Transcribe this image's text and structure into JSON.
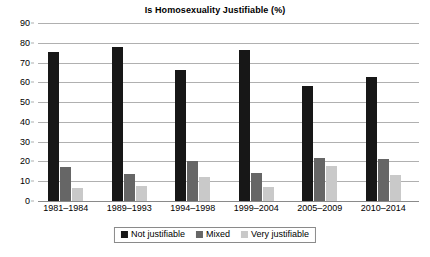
{
  "chart_data": {
    "type": "bar",
    "title": "Is Homosexuality Justifiable (%)",
    "xlabel": "",
    "ylabel": "",
    "ylim": [
      0,
      90
    ],
    "yticks": [
      0,
      10,
      20,
      30,
      40,
      50,
      60,
      70,
      80,
      90
    ],
    "grid": true,
    "legend_position": "bottom",
    "categories": [
      "1981–1984",
      "1989–1993",
      "1994–1998",
      "1999–2004",
      "2005–2009",
      "2010–2014"
    ],
    "series": [
      {
        "name": "Not justifiable",
        "color": "#171717",
        "values": [
          75.3,
          78.0,
          66.3,
          76.5,
          58.1,
          62.8
        ]
      },
      {
        "name": "Mixed",
        "color": "#666666",
        "values": [
          17.3,
          13.6,
          20.2,
          14.4,
          21.8,
          21.1
        ]
      },
      {
        "name": "Very justifiable",
        "color": "#c9c9c9",
        "values": [
          6.5,
          7.4,
          12.3,
          7.2,
          17.6,
          13.4
        ]
      }
    ]
  }
}
